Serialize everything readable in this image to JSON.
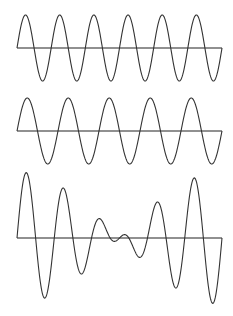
{
  "colors": {
    "background": "#ffffff",
    "axis": "#222222",
    "wave": "#333333"
  },
  "layout": {
    "x_start": 17,
    "x_end": 222
  },
  "waves": [
    {
      "name": "wave-6-cycles",
      "axis_y": 48,
      "amplitude": 33,
      "cycles": 6,
      "phase": 0,
      "type": "sine"
    },
    {
      "name": "wave-5-cycles",
      "axis_y": 131,
      "amplitude": 33,
      "cycles": 5,
      "phase": 0,
      "type": "sine"
    },
    {
      "name": "wave-superposition",
      "axis_y": 238,
      "amplitude": 33,
      "type": "sum",
      "components": [
        0,
        1
      ]
    }
  ],
  "chart_data": {
    "type": "line",
    "title": "",
    "series": [
      {
        "name": "sine 6 cycles",
        "frequency_cycles": 6,
        "amplitude": 1
      },
      {
        "name": "sine 5 cycles",
        "frequency_cycles": 5,
        "amplitude": 1
      },
      {
        "name": "sum",
        "frequency_cycles": "6 + 5",
        "amplitude": 2
      }
    ],
    "xlabel": "",
    "ylabel": "",
    "grid": false
  }
}
